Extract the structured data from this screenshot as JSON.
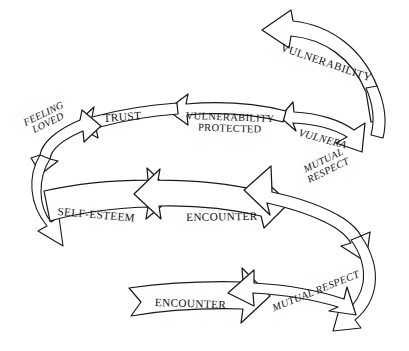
{
  "diagram": {
    "type": "spiral-arrow-cycle",
    "background_color": "#ffffff",
    "line_color": "#1a1a1a",
    "fill_color": "#ffffff",
    "labels": {
      "vulnerability_top": "VULNERABILITY",
      "feeling_loved_line1": "FEELING",
      "feeling_loved_line2": "LOVED",
      "trust": "TRUST",
      "vulnerability_protected_line1": "VULNERABILITY",
      "vulnerability_protected_line2": "PROTECTED",
      "vulnera_truncated": "VULNERA",
      "mutual_respect_mid_line1": "MUTUAL",
      "mutual_respect_mid_line2": "RESPECT",
      "self_esteem": "SELF-ESTEEM",
      "encounter_mid": "ENCOUNTER",
      "encounter_bottom": "ENCOUNTER",
      "mutual_respect_bottom": "MUTUAL RESPECT"
    },
    "segments": [
      {
        "name": "vulnerability-top-band",
        "label": "VULNERABILITY",
        "direction": "left",
        "turn": "upper-outer"
      },
      {
        "name": "vulnera-band",
        "label": "VULNERA",
        "direction": "left",
        "turn": "upper-ring"
      },
      {
        "name": "vulnerability-protected-band",
        "label": "VULNERABILITY PROTECTED",
        "direction": "left",
        "turn": "upper-ring"
      },
      {
        "name": "trust-band",
        "label": "TRUST",
        "direction": "left",
        "turn": "upper-ring"
      },
      {
        "name": "feeling-loved-band",
        "label": "FEELING LOVED",
        "direction": "left",
        "turn": "upper-ring"
      },
      {
        "name": "self-esteem-band",
        "label": "SELF-ESTEEM",
        "direction": "right",
        "turn": "lower-ring"
      },
      {
        "name": "encounter-mid-band",
        "label": "ENCOUNTER",
        "direction": "right",
        "turn": "lower-ring"
      },
      {
        "name": "mutual-respect-mid-band",
        "label": "MUTUAL RESPECT",
        "direction": "right",
        "turn": "lower-ring"
      },
      {
        "name": "encounter-bottom-band",
        "label": "ENCOUNTER",
        "direction": "right",
        "turn": "bottom-outer"
      },
      {
        "name": "mutual-respect-bottom-band",
        "label": "MUTUAL RESPECT",
        "direction": "right",
        "turn": "bottom-outer"
      }
    ]
  }
}
